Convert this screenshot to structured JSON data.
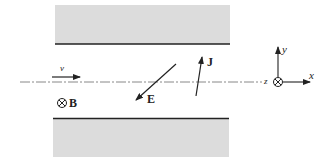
{
  "diagram": {
    "plates": {
      "top": {
        "label": "upper-plate"
      },
      "bottom": {
        "label": "lower-plate"
      },
      "fill_color": "#dcdcdc",
      "edge_color": "#222222"
    },
    "axis_line": {
      "style": "dash-dot",
      "color": "#888888"
    },
    "labels": {
      "velocity": "v",
      "magnetic_field": "B",
      "electric_field": "E",
      "current_density": "J",
      "axis_z": "z",
      "axis_x": "x",
      "axis_y": "y"
    },
    "symbols": {
      "into_page": "⊗"
    }
  }
}
